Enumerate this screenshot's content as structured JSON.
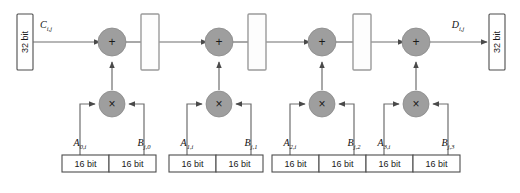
{
  "diagram": {
    "colors": {
      "op_fill": "#9e9e9e",
      "wire": "#6e6e6e",
      "register_stroke": "#9a9a9a",
      "bitbox_stroke": "#4d4d4d",
      "text": "#111111"
    },
    "input_port": {
      "label": "32 bit",
      "signal_base": "C",
      "signal_sub": "i,j"
    },
    "output_port": {
      "label": "32 bit",
      "signal_base": "D",
      "signal_sub": "i,j"
    },
    "adder_glyph": "+",
    "multiplier_glyph": "×",
    "bit_label_16": "16 bit",
    "stages": [
      {
        "index": 0,
        "adder_glyph": "+",
        "multiplier_glyph": "×",
        "operand_a_base": "A",
        "operand_a_sub": "0,i",
        "operand_b_base": "B",
        "operand_b_sub": "j,0",
        "operand_a_width": "16 bit",
        "operand_b_width": "16 bit"
      },
      {
        "index": 1,
        "adder_glyph": "+",
        "multiplier_glyph": "×",
        "operand_a_base": "A",
        "operand_a_sub": "1,i",
        "operand_b_base": "B",
        "operand_b_sub": "j,1",
        "operand_a_width": "16 bit",
        "operand_b_width": "16 bit"
      },
      {
        "index": 2,
        "adder_glyph": "+",
        "multiplier_glyph": "×",
        "operand_a_base": "A",
        "operand_a_sub": "2,i",
        "operand_b_base": "B",
        "operand_b_sub": "j,2",
        "operand_a_width": "16 bit",
        "operand_b_width": "16 bit"
      },
      {
        "index": 3,
        "adder_glyph": "+",
        "multiplier_glyph": "×",
        "operand_a_base": "A",
        "operand_a_sub": "3,i",
        "operand_b_base": "B",
        "operand_b_sub": "j,3",
        "operand_a_width": "16 bit",
        "operand_b_width": "16 bit"
      }
    ],
    "pipeline_registers": [
      {
        "index": 0
      },
      {
        "index": 1
      },
      {
        "index": 2
      }
    ]
  }
}
